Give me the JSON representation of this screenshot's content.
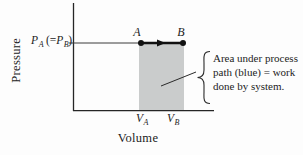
{
  "diagram": {
    "type": "pressure-volume process diagram",
    "axes": {
      "y_label": "Pressure",
      "x_label": "Volume"
    },
    "pressure_level": {
      "p1": "P",
      "p1_sub": "A",
      "open": "(=",
      "p2": "P",
      "p2_sub": "B",
      "close": ")"
    },
    "points": {
      "a": "A",
      "b": "B"
    },
    "volume_ticks": {
      "va": "V",
      "va_sub": "A",
      "vb": "V",
      "vb_sub": "B"
    },
    "annotation": {
      "lines": [
        "Area under process",
        "path (blue) = work",
        "done by system."
      ]
    },
    "colors": {
      "shade": "#cacccc",
      "ink": "#262626"
    }
  }
}
